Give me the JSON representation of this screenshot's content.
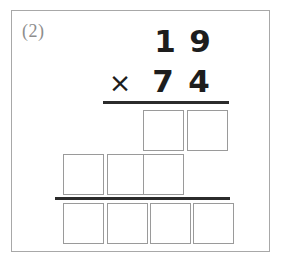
{
  "worksheet": {
    "problem_label": "(2)",
    "problem_type": "long-multiplication-worksheet"
  },
  "problem": {
    "multiplicand": {
      "value": "19",
      "tens": "1",
      "ones": "9"
    },
    "operator": "×",
    "multiplier": {
      "value": "74",
      "tens": "7",
      "ones": "4"
    }
  },
  "work_area": {
    "partial_product_1": {
      "label": "partial-product-row-1",
      "cells": [
        "",
        ""
      ]
    },
    "partial_product_2": {
      "label": "partial-product-row-2",
      "cells": [
        "",
        "",
        ""
      ]
    },
    "final_product": {
      "label": "final-product-row",
      "cells": [
        "",
        "",
        "",
        ""
      ]
    }
  },
  "colors": {
    "card_border": "#a8a8a8",
    "box_border": "#9a9a9a",
    "rule": "#2b2b2b",
    "digit": "#1d1d1d",
    "label": "#8d8d8d",
    "background": "#ffffff"
  }
}
